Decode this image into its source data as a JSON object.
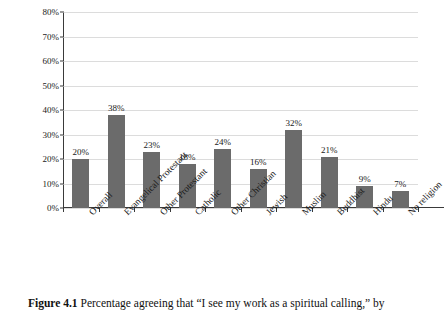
{
  "figure": {
    "caption_label": "Figure 4.1",
    "caption_text": "Percentage agreeing that “I see my work as a spiritual calling,” by"
  },
  "chart_data": {
    "type": "bar",
    "title": "",
    "subtitle": "",
    "xlabel": "",
    "ylabel": "",
    "ylim": [
      0,
      80
    ],
    "ytick_labels": [
      "0%",
      "10%",
      "20%",
      "30%",
      "40%",
      "50%",
      "60%",
      "70%",
      "80%"
    ],
    "ytick_values": [
      0,
      10,
      20,
      30,
      40,
      50,
      60,
      70,
      80
    ],
    "grid": true,
    "legend": "none",
    "bar_color": "#6b6b6b",
    "gridline_color": "#dcdcdc",
    "axis_color": "#3a3a3a",
    "categories": [
      "Overall",
      "Evangelical Protestant",
      "Other Protestant",
      "Catholic",
      "Other Christian",
      "Jewish",
      "Muslim",
      "Buddhist",
      "Hindu",
      "No religion"
    ],
    "values": [
      20,
      38,
      23,
      18,
      24,
      16,
      32,
      21,
      9,
      7
    ],
    "value_labels": [
      "20%",
      "38%",
      "23%",
      "18%",
      "24%",
      "16%",
      "32%",
      "21%",
      "9%",
      "7%"
    ]
  }
}
